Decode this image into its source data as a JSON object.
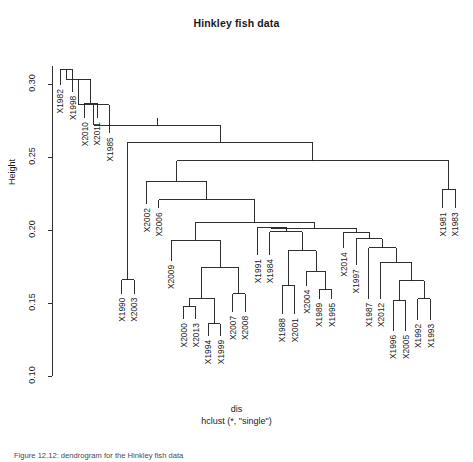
{
  "plot": {
    "title": "Hinkley fish data",
    "ylabel": "Height",
    "xlabel_top": "dis",
    "xlabel_bottom": "hclust (*, \"single\")",
    "caption": "Figure 12.12: dendrogram for the Hinkley fish data",
    "line_color": "#1a1a1a"
  },
  "chart_data": {
    "type": "dendrogram",
    "title": "Hinkley fish data",
    "xlabel": "dis",
    "sublabel": "hclust (*, \"single\")",
    "ylabel": "Height",
    "ylim": [
      0.1,
      0.325
    ],
    "yticks": [
      0.1,
      0.15,
      0.2,
      0.25,
      0.3
    ],
    "ytick_labels": [
      "0.10",
      "0.15",
      "0.20",
      "0.25",
      "0.30"
    ],
    "grid": false,
    "legend": false,
    "method": "single",
    "distance": "dis",
    "n_leaves": 33,
    "leaf_order": [
      "X1982",
      "X1998",
      "X2010",
      "X2011",
      "X1985",
      "X1990",
      "X2003",
      "X2002",
      "X2006",
      "X2009",
      "X2000",
      "X2013",
      "X1994",
      "X1999",
      "X2007",
      "X2008",
      "X1991",
      "X1984",
      "X1988",
      "X2001",
      "X2004",
      "X1989",
      "X1995",
      "X2014",
      "X1997",
      "X1987",
      "X2012",
      "X1996",
      "X2005",
      "X1992",
      "X1993",
      "X1981",
      "X1983"
    ],
    "leaves": [
      {
        "label": "X1982",
        "x": 0
      },
      {
        "label": "X1998",
        "x": 1
      },
      {
        "label": "X2010",
        "x": 2
      },
      {
        "label": "X2011",
        "x": 3
      },
      {
        "label": "X1985",
        "x": 4
      },
      {
        "label": "X1990",
        "x": 5
      },
      {
        "label": "X2003",
        "x": 6
      },
      {
        "label": "X2002",
        "x": 7
      },
      {
        "label": "X2006",
        "x": 8
      },
      {
        "label": "X2009",
        "x": 9
      },
      {
        "label": "X2000",
        "x": 10
      },
      {
        "label": "X2013",
        "x": 11
      },
      {
        "label": "X1994",
        "x": 12
      },
      {
        "label": "X1999",
        "x": 13
      },
      {
        "label": "X2007",
        "x": 14
      },
      {
        "label": "X2008",
        "x": 15
      },
      {
        "label": "X1991",
        "x": 16
      },
      {
        "label": "X1984",
        "x": 17
      },
      {
        "label": "X1988",
        "x": 18
      },
      {
        "label": "X2001",
        "x": 19
      },
      {
        "label": "X2004",
        "x": 20
      },
      {
        "label": "X1989",
        "x": 21
      },
      {
        "label": "X1995",
        "x": 22
      },
      {
        "label": "X2014",
        "x": 23
      },
      {
        "label": "X1997",
        "x": 24
      },
      {
        "label": "X1987",
        "x": 25
      },
      {
        "label": "X2012",
        "x": 26
      },
      {
        "label": "X1996",
        "x": 27
      },
      {
        "label": "X2005",
        "x": 28
      },
      {
        "label": "X1992",
        "x": 29
      },
      {
        "label": "X1993",
        "x": 30
      },
      {
        "label": "X1981",
        "x": 31
      },
      {
        "label": "X1983",
        "x": 32
      }
    ],
    "leaf_tip_heights": [
      0.2995,
      0.295,
      0.277,
      0.277,
      0.2665,
      0.1565,
      0.1565,
      0.218,
      0.215,
      0.179,
      0.139,
      0.139,
      0.1275,
      0.1275,
      0.144,
      0.144,
      0.183,
      0.183,
      0.1425,
      0.1425,
      0.162,
      0.153,
      0.153,
      0.1875,
      0.176,
      0.153,
      0.153,
      0.131,
      0.131,
      0.1385,
      0.1385,
      0.215,
      0.215
    ],
    "merges": [
      {
        "id": "m1",
        "left": "X1982",
        "right": "X1998",
        "height": 0.3105
      },
      {
        "id": "m2",
        "left": "X2010",
        "right": "X2011",
        "height": 0.287
      },
      {
        "id": "m3",
        "left": "m2",
        "right": "m1",
        "height": 0.3035
      },
      {
        "id": "m4",
        "left": "X1985",
        "right": "m3",
        "height": 0.286
      },
      {
        "id": "m5",
        "left": "X1990",
        "right": "X2003",
        "height": 0.166
      },
      {
        "id": "m6",
        "left": "X2000",
        "right": "X2013",
        "height": 0.1475
      },
      {
        "id": "m7",
        "left": "X1994",
        "right": "X1999",
        "height": 0.136
      },
      {
        "id": "m8",
        "left": "m6",
        "right": "m7",
        "height": 0.1535
      },
      {
        "id": "m9",
        "left": "X2007",
        "right": "X2008",
        "height": 0.1565
      },
      {
        "id": "m10",
        "left": "m8",
        "right": "m9",
        "height": 0.1745
      },
      {
        "id": "m11",
        "left": "X2009",
        "right": "m10",
        "height": 0.193
      },
      {
        "id": "m12",
        "left": "X1988",
        "right": "X2001",
        "height": 0.162
      },
      {
        "id": "m13",
        "left": "X1989",
        "right": "X1995",
        "height": 0.159
      },
      {
        "id": "m14",
        "left": "X2004",
        "right": "m13",
        "height": 0.172
      },
      {
        "id": "m15",
        "left": "m12",
        "right": "m14",
        "height": 0.186
      },
      {
        "id": "m16",
        "left": "X1984",
        "right": "m15",
        "height": 0.199
      },
      {
        "id": "m17",
        "left": "X1991",
        "right": "m16",
        "height": 0.202
      },
      {
        "id": "m18",
        "left": "X1996",
        "right": "X2005",
        "height": 0.1515
      },
      {
        "id": "m19",
        "left": "X1992",
        "right": "X1993",
        "height": 0.153
      },
      {
        "id": "m20",
        "left": "m18",
        "right": "m19",
        "height": 0.1655
      },
      {
        "id": "m21",
        "left": "X2012",
        "right": "m20",
        "height": 0.178
      },
      {
        "id": "m22",
        "left": "X1987",
        "right": "m21",
        "height": 0.188
      },
      {
        "id": "m23",
        "left": "X1997",
        "right": "m22",
        "height": 0.194
      },
      {
        "id": "m24",
        "left": "X2014",
        "right": "m23",
        "height": 0.1985
      },
      {
        "id": "m25",
        "left": "m17",
        "right": "m24",
        "height": 0.201
      },
      {
        "id": "m26",
        "left": "m11",
        "right": "m25",
        "height": 0.2055
      },
      {
        "id": "m27",
        "left": "X2006",
        "right": "m26",
        "height": 0.221
      },
      {
        "id": "m28",
        "left": "X2002",
        "right": "m27",
        "height": 0.2335
      },
      {
        "id": "m29",
        "left": "X1981",
        "right": "X1983",
        "height": 0.228
      },
      {
        "id": "m30",
        "left": "m28",
        "right": "m29",
        "height": 0.2475
      },
      {
        "id": "m31",
        "left": "m5",
        "right": "m30",
        "height": 0.2605
      },
      {
        "id": "m32",
        "left": "m4",
        "right": "m31",
        "height": 0.272
      }
    ],
    "root": "m32"
  }
}
